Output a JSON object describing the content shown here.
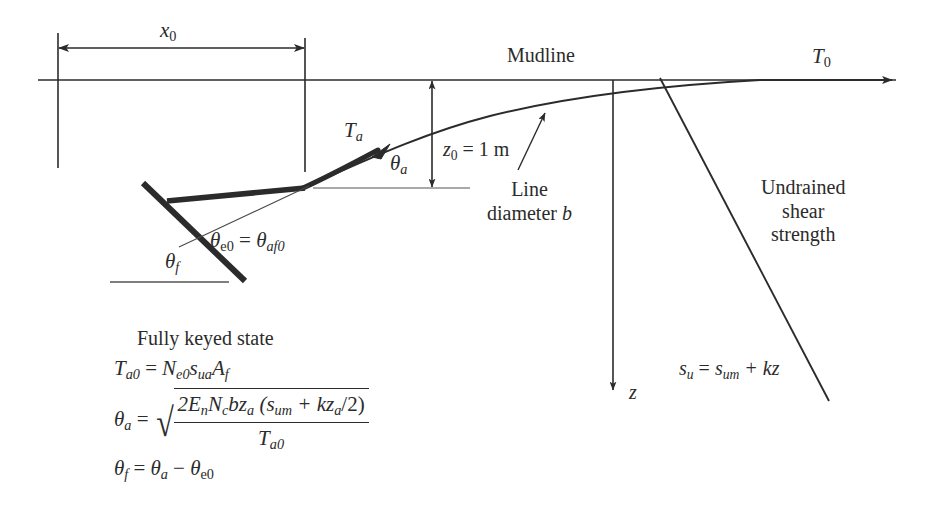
{
  "figure": {
    "type": "engineering-diagram"
  },
  "labels": {
    "x0": "x",
    "x0_sub": "0",
    "mudline": "Mudline",
    "T0": "T",
    "T0_sub": "0",
    "Ta": "T",
    "Ta_sub": "a",
    "theta_a": "θ",
    "theta_a_sub": "a",
    "z0_value": "z",
    "z0_sub": "0",
    "z0_eq": " = 1 m",
    "line_diameter_1": "Line",
    "line_diameter_2": "diameter ",
    "line_diameter_b": "b",
    "undrained_1": "Undrained",
    "undrained_2": "shear",
    "undrained_3": "strength",
    "theta_e0": "θ",
    "theta_e0_sub": "e0",
    "theta_e0_eq": " = ",
    "theta_af0": "θ",
    "theta_af0_sub": "af0",
    "theta_f": "θ",
    "theta_f_sub": "f",
    "z_axis": "z",
    "su_lhs": "s",
    "su_lhs_sub": "u",
    "su_eq": " = ",
    "su_rhs": "s",
    "su_rhs_sub": "um",
    "su_plus": " + kz",
    "fully_keyed": "Fully keyed state"
  },
  "equations": {
    "eq1": {
      "lhs_base": "T",
      "lhs_sub": "a0",
      "eq": " = ",
      "rhs": "N",
      "rhs_sub1": "e0",
      "rhs_s": "s",
      "rhs_s_sub": "ua",
      "rhs_A": "A",
      "rhs_A_sub": "f"
    },
    "eq2": {
      "lhs_base": "θ",
      "lhs_sub": "a",
      "eq": " = ",
      "radical": "√",
      "numerator_1": "2E",
      "numerator_1_sub": "n",
      "numerator_2": "N",
      "numerator_2_sub": "c",
      "numerator_3": "bz",
      "numerator_3_sub": "a",
      "numerator_4": " (s",
      "numerator_4_sub": "um",
      "numerator_5": " + kz",
      "numerator_5_sub": "a",
      "numerator_6": "/2)",
      "denominator": "T",
      "denominator_sub": "a0"
    },
    "eq3": {
      "lhs_base": "θ",
      "lhs_sub": "f",
      "eq": " = ",
      "rhs_1": "θ",
      "rhs_1_sub": "a",
      "minus": " − ",
      "rhs_2": "θ",
      "rhs_2_sub": "e0"
    }
  },
  "colors": {
    "ink": "#2b2b2b",
    "background": "#ffffff",
    "thin_line": "#3a3a3a"
  }
}
